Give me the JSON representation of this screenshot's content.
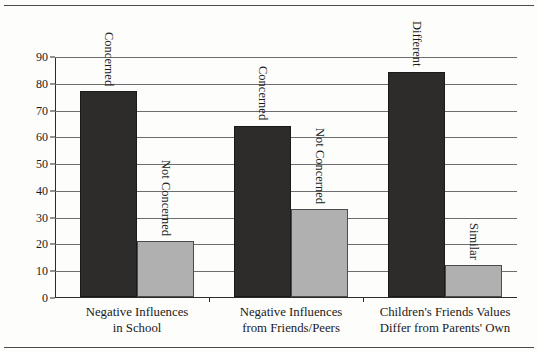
{
  "chart_data": {
    "type": "bar",
    "title": "",
    "subtitle": "",
    "xlabel": "",
    "ylabel": "",
    "ylim": [
      0,
      90
    ],
    "yticks": [
      0,
      10,
      20,
      30,
      40,
      50,
      60,
      70,
      80,
      90
    ],
    "grid": true,
    "legend_position": "none",
    "categories": [
      "Negative Influences in School",
      "Negative Influences from Friends/Peers",
      "Children's Friends Values Differ from Parents' Own"
    ],
    "category_lines": [
      [
        "Negative Influences",
        "in School"
      ],
      [
        "Negative Influences",
        "from Friends/Peers"
      ],
      [
        "Children's Friends Values",
        "Differ from Parents' Own"
      ]
    ],
    "bars": [
      {
        "category_index": 0,
        "label": "Concerned",
        "value": 77,
        "color": "#2e2b2b",
        "series": "primary"
      },
      {
        "category_index": 0,
        "label": "Not Concerned",
        "value": 21,
        "color": "#b0b0b0",
        "series": "secondary"
      },
      {
        "category_index": 1,
        "label": "Concerned",
        "value": 64,
        "color": "#2e2b2b",
        "series": "primary"
      },
      {
        "category_index": 1,
        "label": "Not Concerned",
        "value": 33,
        "color": "#b0b0b0",
        "series": "secondary"
      },
      {
        "category_index": 2,
        "label": "Different",
        "value": 84,
        "color": "#2e2b2b",
        "series": "primary"
      },
      {
        "category_index": 2,
        "label": "Similar",
        "value": 12,
        "color": "#b0b0b0",
        "series": "secondary"
      }
    ],
    "series": [
      {
        "name": "primary",
        "values": [
          77,
          64,
          84
        ],
        "color": "#2e2b2b"
      },
      {
        "name": "secondary",
        "values": [
          21,
          33,
          12
        ],
        "color": "#b0b0b0"
      }
    ],
    "annotations": []
  },
  "axis": {
    "y_tick_labels": [
      "0",
      "10",
      "20",
      "30",
      "40",
      "50",
      "60",
      "70",
      "80",
      "90"
    ]
  },
  "colors": {
    "dark_bar": "#2e2b2b",
    "light_bar": "#b0b0b0",
    "gridline": "#6e6e6e",
    "axis": "#2b2b2b",
    "background": "#fdfdfb"
  }
}
